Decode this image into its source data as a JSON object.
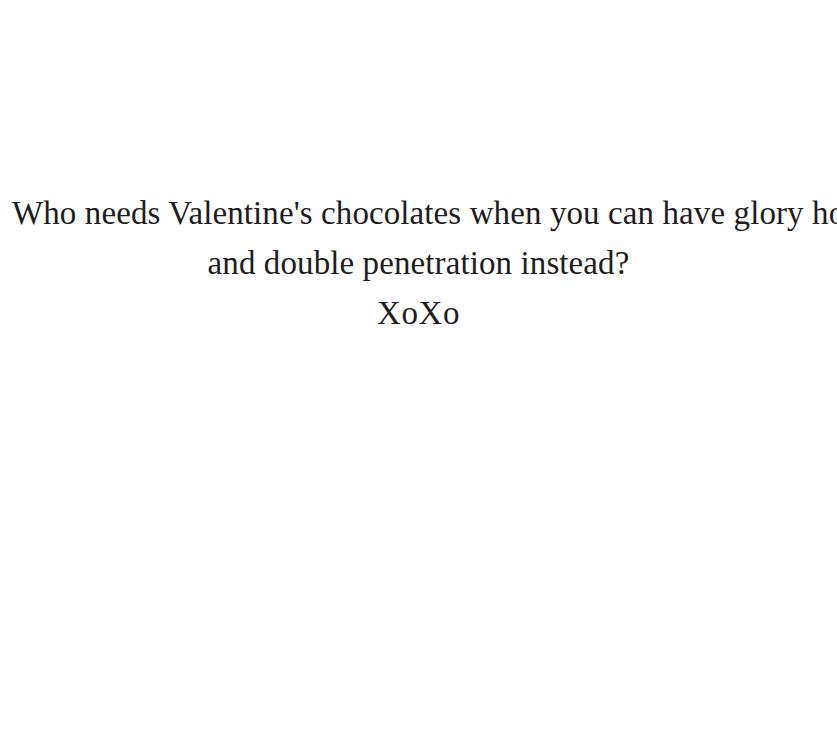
{
  "document": {
    "type": "greeting-card-text-image",
    "background_color": "#ffffff",
    "text_color": "#1f1d22",
    "alignment": "center",
    "lines": [
      {
        "id": "line-1",
        "text": "Who needs Valentine's chocolates when you can have glory holes"
      },
      {
        "id": "line-2",
        "text": "and double penetration instead?"
      },
      {
        "id": "line-3",
        "text": "XoXo"
      }
    ]
  }
}
